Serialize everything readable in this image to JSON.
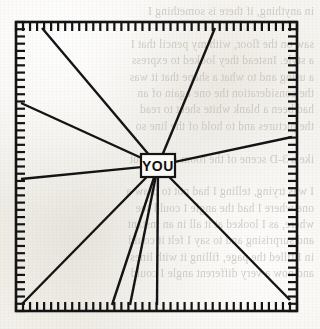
{
  "figure": {
    "type": "radial-diagram",
    "center_label": "YOU",
    "frame": {
      "shape": "square",
      "x": 16,
      "y": 22,
      "width": 281,
      "height": 289,
      "border_style": "comb-ticks-inward",
      "tick_count_per_side": 40,
      "tick_length": 9,
      "line_color": "#141414",
      "line_width": 2.6
    },
    "center_box": {
      "x": 141,
      "y": 154,
      "width": 34,
      "height": 23,
      "fill": "#faf9f6",
      "border_color": "#141414",
      "border_width": 2.2
    },
    "rays": [
      {
        "name": "ray-upper-left",
        "to_x": 42,
        "to_y": 28
      },
      {
        "name": "ray-upper-right",
        "to_x": 215,
        "to_y": 28
      },
      {
        "name": "ray-left-upper",
        "to_x": 21,
        "to_y": 103
      },
      {
        "name": "ray-left-lower",
        "to_x": 21,
        "to_y": 179
      },
      {
        "name": "ray-right",
        "to_x": 292,
        "to_y": 137
      },
      {
        "name": "ray-lower-left-corner",
        "to_x": 23,
        "to_y": 303
      },
      {
        "name": "ray-bottom-left",
        "to_x": 112,
        "to_y": 305
      },
      {
        "name": "ray-bottom-mid",
        "to_x": 130,
        "to_y": 305
      },
      {
        "name": "ray-bottom-right",
        "to_x": 157,
        "to_y": 305
      },
      {
        "name": "ray-lower-right-corner",
        "to_x": 290,
        "to_y": 300
      }
    ],
    "background": {
      "paper_color": "#f3f1ed",
      "ink_color": "#141414",
      "ghost_text_color": "#b9b2a8"
    },
    "ghost_lines": [
      "in anything, if there is something I",
      "",
      "saw on the floor, with my pencil that I",
      "a style. Instead they looked to express",
      "a using and to what a shape that it was",
      "the consideration the one again of an",
      "had been a blank white sheet to read",
      "the pictures and to hold of the line so",
      "",
      "ike a 3-D scene of the room drawn out",
      "",
      "I was trying, telling I had not to draw a",
      "one where I had the angle I could see",
      "where, as I looked at it all in an instant",
      "and surprising and to say I felt it could",
      "in I filled the page, filling it with lines",
      "and now a very different angle I could"
    ]
  }
}
